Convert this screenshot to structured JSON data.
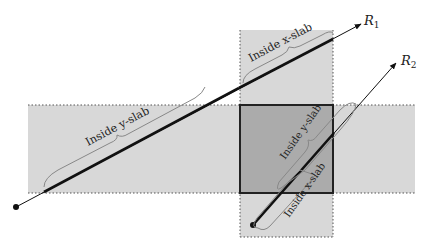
{
  "diagram": {
    "x_slab": {
      "label": "Inside x-slab",
      "x": [
        240,
        333
      ],
      "y": [
        30,
        237
      ],
      "fill": "#d6d6d6"
    },
    "y_slab": {
      "label": "Inside y-slab",
      "x": [
        28,
        415
      ],
      "y": [
        105,
        193
      ],
      "fill": "#d6d6d6"
    },
    "box": {
      "x": [
        240,
        333
      ],
      "y": [
        105,
        193
      ],
      "fill": "#a9a9a9",
      "stroke": "#222222"
    },
    "rays": [
      {
        "name": "R",
        "sub": "1",
        "origin": [
          16,
          207
        ],
        "tip": [
          361,
          24
        ]
      },
      {
        "name": "R",
        "sub": "2",
        "origin": [
          253,
          225
        ],
        "tip": [
          396,
          63
        ]
      }
    ],
    "annotations": {
      "r1_y": "Inside y-slab",
      "r1_x": "Inside x-slab",
      "r2_y": "Inside y-slab",
      "r2_x": "Inside x-slab"
    },
    "colors": {
      "brace": "#8a8a8a",
      "ray": "#111111"
    }
  }
}
